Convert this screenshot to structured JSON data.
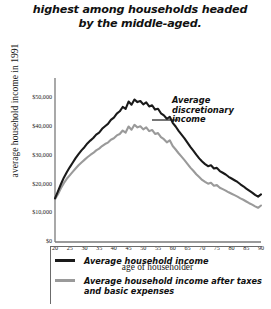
{
  "title": "highest among households headed by the middle-aged.",
  "annotation": "Average discretionary income",
  "legend": {
    "items": [
      {
        "label": "Average household income",
        "color": "#1a1a1a"
      },
      {
        "label": "Average household income after taxes and basic expenses",
        "color": "#9a9a9a"
      }
    ]
  },
  "chart_data": {
    "type": "line",
    "title": "highest among households headed by the middle-aged.",
    "xlabel": "age of householder",
    "ylabel": "average household income in 1991",
    "xlim": [
      20,
      90
    ],
    "ylim": [
      0,
      55000
    ],
    "grid": false,
    "legend_position": "bottom",
    "xticks": [
      20,
      25,
      30,
      35,
      40,
      45,
      50,
      55,
      60,
      65,
      70,
      75,
      80,
      85,
      90
    ],
    "yticks": [
      0,
      10000,
      20000,
      30000,
      40000,
      50000
    ],
    "ytick_labels": [
      "$0",
      "$10,000",
      "$20,000",
      "$30,000",
      "$40,000",
      "$50,000"
    ],
    "annotations": [
      {
        "text": "Average discretionary income",
        "x": 57,
        "y": 43000
      }
    ],
    "x": [
      20,
      21,
      22,
      23,
      24,
      25,
      26,
      27,
      28,
      29,
      30,
      31,
      32,
      33,
      34,
      35,
      36,
      37,
      38,
      39,
      40,
      41,
      42,
      43,
      44,
      45,
      46,
      47,
      48,
      49,
      50,
      51,
      52,
      53,
      54,
      55,
      56,
      57,
      58,
      59,
      60,
      61,
      62,
      63,
      64,
      65,
      66,
      67,
      68,
      69,
      70,
      71,
      72,
      73,
      74,
      75,
      76,
      77,
      78,
      79,
      80,
      81,
      82,
      83,
      84,
      85,
      86,
      87,
      88,
      89,
      90
    ],
    "series": [
      {
        "name": "Average household income",
        "color": "#1a1a1a",
        "values": [
          15200,
          17600,
          20100,
          22400,
          24300,
          26000,
          27600,
          29200,
          30600,
          31900,
          33000,
          34300,
          35300,
          36200,
          37400,
          38100,
          39400,
          40300,
          41100,
          42500,
          43300,
          44700,
          45500,
          47000,
          46300,
          48900,
          47800,
          49600,
          48700,
          49100,
          47900,
          48600,
          47200,
          47600,
          46100,
          46400,
          44800,
          44100,
          42900,
          43600,
          41500,
          40200,
          38700,
          37400,
          36100,
          34600,
          33100,
          31800,
          30400,
          29100,
          28000,
          27100,
          26400,
          26700,
          25600,
          25800,
          24700,
          24100,
          23500,
          22700,
          22100,
          21500,
          20900,
          20100,
          19400,
          18600,
          17900,
          17200,
          16400,
          15800,
          16600
        ]
      },
      {
        "name": "Average household income after taxes and basic expenses",
        "color": "#9a9a9a",
        "values": [
          14900,
          16600,
          18700,
          20500,
          22000,
          23200,
          24400,
          25600,
          26700,
          27700,
          28600,
          29500,
          30300,
          31000,
          31900,
          32500,
          33400,
          34100,
          34600,
          35600,
          36100,
          37100,
          37600,
          38800,
          38100,
          40200,
          39100,
          40800,
          39900,
          40300,
          39200,
          39900,
          38600,
          39000,
          37600,
          37900,
          36500,
          35800,
          34700,
          35400,
          33400,
          32200,
          30900,
          29700,
          28500,
          27200,
          25900,
          24800,
          23600,
          22600,
          21600,
          20900,
          20300,
          20600,
          19600,
          19800,
          18900,
          18400,
          17900,
          17300,
          16800,
          16300,
          15800,
          15200,
          14700,
          14100,
          13500,
          13000,
          12400,
          11900,
          12700
        ]
      }
    ]
  }
}
